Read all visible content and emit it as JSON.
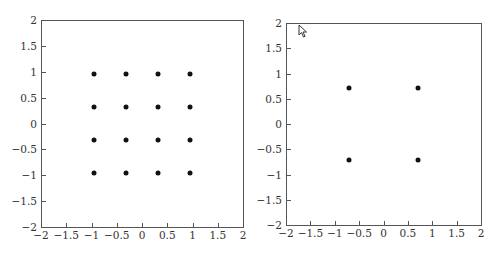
{
  "chart_data": [
    {
      "type": "scatter",
      "title": "",
      "xlabel": "",
      "ylabel": "",
      "xlim": [
        -2,
        2
      ],
      "ylim": [
        -2,
        2
      ],
      "grid": false,
      "legend": null,
      "xticks": [
        "-2",
        "-1.5",
        "-1",
        "-0.5",
        "0",
        "0.5",
        "1",
        "1.5",
        "2"
      ],
      "yticks": [
        "2",
        "1.5",
        "1",
        "0.5",
        "0",
        "-0.5",
        "-1",
        "-1.5",
        "-2"
      ],
      "series": [
        {
          "name": "16-QAM constellation",
          "points": [
            [
              -0.95,
              0.95
            ],
            [
              -0.32,
              0.95
            ],
            [
              0.32,
              0.95
            ],
            [
              0.95,
              0.95
            ],
            [
              -0.95,
              0.32
            ],
            [
              -0.32,
              0.32
            ],
            [
              0.32,
              0.32
            ],
            [
              0.95,
              0.32
            ],
            [
              -0.95,
              -0.32
            ],
            [
              -0.32,
              -0.32
            ],
            [
              0.32,
              -0.32
            ],
            [
              0.95,
              -0.32
            ],
            [
              -0.95,
              -0.95
            ],
            [
              -0.32,
              -0.95
            ],
            [
              0.32,
              -0.95
            ],
            [
              0.95,
              -0.95
            ]
          ],
          "color": "#111111"
        }
      ]
    },
    {
      "type": "scatter",
      "title": "",
      "xlabel": "",
      "ylabel": "",
      "xlim": [
        -2,
        2
      ],
      "ylim": [
        -2,
        2
      ],
      "grid": false,
      "legend": null,
      "xticks": [
        "-2",
        "-1.5",
        "-1",
        "-0.5",
        "0",
        "0.5",
        "1",
        "1.5",
        "2"
      ],
      "yticks": [
        "2",
        "1.5",
        "1",
        "0.5",
        "0",
        "-0.5",
        "-1",
        "-1.5",
        "-2"
      ],
      "series": [
        {
          "name": "QPSK constellation",
          "points": [
            [
              -0.71,
              0.71
            ],
            [
              0.71,
              0.71
            ],
            [
              -0.71,
              -0.71
            ],
            [
              0.71,
              -0.71
            ]
          ],
          "color": "#111111"
        }
      ]
    }
  ],
  "labels": {
    "xticks": [
      "−2",
      "−1.5",
      "−1",
      "−0.5",
      "0",
      "0.5",
      "1",
      "1.5",
      "2"
    ],
    "yticks": [
      "2",
      "1.5",
      "1",
      "0.5",
      "0",
      "−0.5",
      "−1",
      "−1.5",
      "−2"
    ]
  }
}
